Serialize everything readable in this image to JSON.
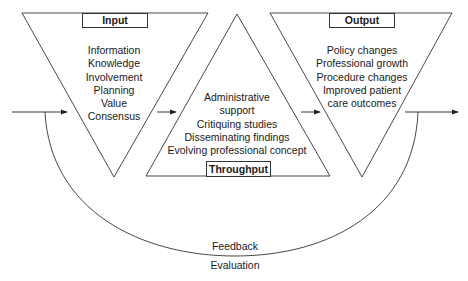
{
  "diagram": {
    "input": {
      "title": "Input",
      "items": [
        "Information",
        "Knowledge",
        "Involvement",
        "Planning",
        "Value",
        "Consensus"
      ]
    },
    "throughput": {
      "title": "Throughput",
      "items": [
        "Administrative",
        "support",
        "Critiquing studies",
        "Disseminating findings",
        "Evolving professional concept"
      ]
    },
    "output": {
      "title": "Output",
      "items": [
        "Policy changes",
        "Professional growth",
        "Procedure changes",
        "Improved patient",
        "care outcomes"
      ]
    },
    "feedback": {
      "label_top": "Feedback",
      "label_bottom": "Evaluation"
    },
    "colors": {
      "stroke": "#333333",
      "background": "#ffffff",
      "text": "#1a1a1a"
    }
  }
}
